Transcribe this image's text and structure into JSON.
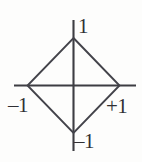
{
  "figure": {
    "background_color": "#fdfdfc",
    "line_color": "#3d3d42",
    "text_color": "#2f2f33"
  },
  "labels": {
    "top": "1",
    "left": "–1",
    "right": "+1",
    "bottom": "–1"
  },
  "chart_data": {
    "type": "line",
    "title": "",
    "subtitle": "",
    "xlabel": "",
    "ylabel": "",
    "xlim": [
      -1.4,
      1.45
    ],
    "ylim": [
      -1.5,
      1.5
    ],
    "grid": false,
    "legend": null,
    "axes": {
      "x_axis": {
        "visible": true,
        "from": -1.4,
        "to": 1.45,
        "tick_labels": [
          "–1",
          "+1"
        ],
        "tick_values": [
          -1,
          1
        ]
      },
      "y_axis": {
        "visible": true,
        "from": -1.5,
        "to": 1.5,
        "tick_labels": [
          "–1",
          "1"
        ],
        "tick_values": [
          -1,
          1
        ]
      }
    },
    "series": [
      {
        "name": "L1 unit ball boundary |x| + |y| = 1",
        "closed": true,
        "x": [
          0,
          1,
          0,
          -1,
          0
        ],
        "y": [
          1,
          0,
          -1,
          0,
          1
        ]
      }
    ],
    "annotations": [
      {
        "text": "1",
        "x": 0,
        "y": 1,
        "position": "top-right"
      },
      {
        "text": "+1",
        "x": 1,
        "y": 0,
        "position": "bottom-right"
      },
      {
        "text": "–1",
        "x": -1,
        "y": 0,
        "position": "bottom-left"
      },
      {
        "text": "–1",
        "x": 0,
        "y": -1,
        "position": "bottom-right"
      }
    ]
  }
}
